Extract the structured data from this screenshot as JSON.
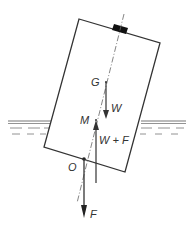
{
  "diagram": {
    "labels": {
      "G": "G",
      "W": "W",
      "M": "M",
      "W_plus_F": "W + F",
      "O": "O",
      "F": "F"
    },
    "forces": [
      {
        "name": "W",
        "direction": "down",
        "from_point": "G"
      },
      {
        "name": "W + F",
        "direction": "up",
        "to_point": "M"
      },
      {
        "name": "F",
        "direction": "down",
        "from_point": "O"
      }
    ],
    "colors": {
      "line": "#333333",
      "block": "#111111",
      "water_line": "#777777",
      "background": "#ffffff"
    }
  }
}
